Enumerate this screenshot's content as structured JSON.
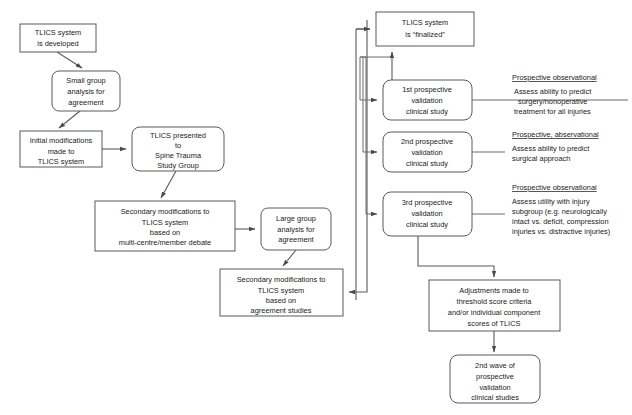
{
  "diagram": {
    "background_color": "#ffffff",
    "line_color": "#5a5a5a",
    "text_color": "#1a1a1a"
  },
  "nodes": {
    "tlics_developed": {
      "id": "tlics-developed",
      "shape": "rect",
      "x": 20,
      "y": 24,
      "w": 76,
      "h": 28,
      "lines": [
        "TLICS system",
        "is developed"
      ]
    },
    "small_group": {
      "id": "small-group-analysis",
      "shape": "rounded",
      "x": 52,
      "y": 71,
      "w": 68,
      "h": 40,
      "lines": [
        "Small group",
        "analysis for",
        "agreement"
      ]
    },
    "initial_mods": {
      "id": "initial-modifications",
      "shape": "rect",
      "x": 20,
      "y": 131,
      "w": 82,
      "h": 36,
      "lines": [
        "Initial modifications",
        "made to",
        "TLICS system"
      ]
    },
    "presented_stsg": {
      "id": "tlics-presented-spine-trauma-study-group",
      "shape": "rounded",
      "x": 132,
      "y": 127,
      "w": 92,
      "h": 44,
      "lines": [
        "TLICS  presented",
        "to",
        "Spine Trauma",
        "Study Group"
      ]
    },
    "secondary_mods_debate": {
      "id": "secondary-modifications-debate",
      "shape": "rect",
      "x": 95,
      "y": 201,
      "w": 140,
      "h": 50,
      "lines": [
        "Secondary modifications to",
        "TLICS system",
        "based on",
        "multi-centre/member debate"
      ]
    },
    "large_group": {
      "id": "large-group-analysis",
      "shape": "rounded",
      "x": 261,
      "y": 208,
      "w": 70,
      "h": 42,
      "lines": [
        "Large group",
        "analysis for",
        "agreement"
      ]
    },
    "secondary_mods_agreement": {
      "id": "secondary-modifications-agreement-studies",
      "shape": "rect",
      "x": 220,
      "y": 269,
      "w": 123,
      "h": 47,
      "lines": [
        "Secondary modifications to",
        "TLICS system",
        "based on",
        "agreement studies"
      ]
    },
    "tlics_finalized": {
      "id": "tlics-finalized",
      "shape": "rect",
      "x": 376,
      "y": 12,
      "w": 98,
      "h": 34,
      "lines": [
        "TLICS system",
        "is “finalized”"
      ]
    },
    "study_1": {
      "id": "first-prospective-validation-clinical-study",
      "shape": "rounded",
      "x": 383,
      "y": 80,
      "w": 89,
      "h": 40,
      "lines": [
        "1st prospective",
        "validation",
        "clinical study"
      ]
    },
    "study_2": {
      "id": "second-prospective-validation-clinical-study",
      "shape": "rounded",
      "x": 383,
      "y": 132,
      "w": 89,
      "h": 40,
      "lines": [
        "2nd prospective",
        "validation",
        "clinical study"
      ]
    },
    "study_3": {
      "id": "third-prospective-validation-clinical-study",
      "shape": "rounded",
      "x": 383,
      "y": 192,
      "w": 89,
      "h": 44,
      "lines": [
        "3rd prospective",
        "validation",
        "clinical study"
      ]
    },
    "adjustments": {
      "id": "adjustments-threshold-score",
      "shape": "rect",
      "x": 429,
      "y": 280,
      "w": 131,
      "h": 51,
      "lines": [
        "Adjustments made to",
        "threshold score criteria",
        "and/or individual component",
        "scores of TLICS"
      ]
    },
    "second_wave": {
      "id": "second-wave-prospective-validation",
      "shape": "rounded",
      "x": 450,
      "y": 355,
      "w": 90,
      "h": 48,
      "lines": [
        "2nd wave of",
        "prospective",
        "validation",
        "clinical studies"
      ]
    }
  },
  "annotations": [
    {
      "id": "annotation-study-1",
      "heading": "Prospective observational",
      "body": [
        "Assess ability to predict",
        "surgery/nonoperative",
        "treatment for all injuries"
      ],
      "x": 508,
      "heading_y": 80,
      "body_y": 93
    },
    {
      "id": "annotation-study-2",
      "heading": "Prospective, abservational",
      "body": [
        "Assess ability to predict",
        "surgical approach"
      ],
      "x": 508,
      "heading_y": 137,
      "body_y": 150
    },
    {
      "id": "annotation-study-3",
      "heading": "Prospective observational",
      "body": [
        "Assess utility with injury",
        "subgroup (e.g. neurologically",
        "intact vs. deficit, compression",
        "injuries vs. distractive injuries)"
      ],
      "x": 508,
      "heading_y": 190,
      "body_y": 203
    }
  ],
  "connectors": [
    {
      "id": "conn-developed-to-smallgroup",
      "kind": "arrow-diagonal"
    },
    {
      "id": "conn-smallgroup-to-initialmods",
      "kind": "arrow-diagonal"
    },
    {
      "id": "conn-initialmods-to-presented",
      "kind": "arrow-horizontal"
    },
    {
      "id": "conn-presented-to-secondarymods",
      "kind": "arrow-diagonal"
    },
    {
      "id": "conn-secondarymods-to-largegroup",
      "kind": "arrow-horizontal"
    },
    {
      "id": "conn-largegroup-to-agreementmods",
      "kind": "arrow-diagonal"
    },
    {
      "id": "conn-trunk-to-agreementmods",
      "kind": "arrow-orthogonal"
    },
    {
      "id": "conn-trunk-to-finalized",
      "kind": "arrow-orthogonal"
    },
    {
      "id": "conn-trunk-to-study1",
      "kind": "arrow-orthogonal"
    },
    {
      "id": "conn-trunk-to-study2",
      "kind": "arrow-orthogonal"
    },
    {
      "id": "conn-trunk-to-study3",
      "kind": "arrow-orthogonal"
    },
    {
      "id": "conn-study1-to-finalized",
      "kind": "arrow-orthogonal"
    },
    {
      "id": "conn-study1-to-annotation",
      "kind": "leader-line"
    },
    {
      "id": "conn-study2-to-annotation",
      "kind": "leader-line"
    },
    {
      "id": "conn-study3-to-annotation",
      "kind": "leader-line"
    },
    {
      "id": "conn-study3-to-adjustments",
      "kind": "arrow-orthogonal"
    },
    {
      "id": "conn-adjustments-to-secondwave",
      "kind": "arrow-vertical"
    }
  ]
}
